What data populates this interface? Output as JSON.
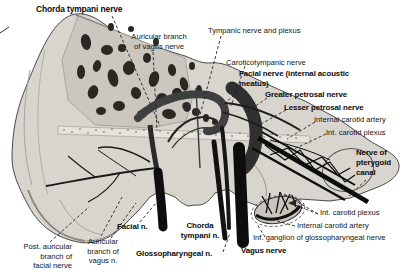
{
  "labels": {
    "chorda_tympani_top": {
      "text": "Chorda tympani nerve"
    },
    "auricular_vagus_top": {
      "text": "Auricular branch\nof vagus nerve"
    },
    "tympanic_plexus": {
      "text": "Tympanic nerve and plexus"
    },
    "caroticotympanic": {
      "text": "Caroticotympanic nerve"
    },
    "facial_iam": {
      "text": "Facial nerve (internal acoustic\nmeatus)"
    },
    "greater_petrosal": {
      "text": "Greater petrosal nerve"
    },
    "lesser_petrosal": {
      "text": "Lesser petrosal nerve"
    },
    "internal_carotid_artery_upper": {
      "text": "Internal carotid artery"
    },
    "int_carotid_plexus_upper": {
      "text": "Int. carotid plexus"
    },
    "nerve_pterygoid_canal": {
      "text": "Nerve of\npterygoid\ncanal"
    },
    "int_carotid_plexus_lower": {
      "text": "Int. carotid plexus"
    },
    "internal_carotid_artery_lower": {
      "text": "Internal carotid artery"
    },
    "inf_ganglion": {
      "text": "Inf. ganglion of glossopharyngeal nerve"
    },
    "vagus_nerve": {
      "text": "Vagus nerve"
    },
    "glossopharyngeal": {
      "text": "Glossopharyngeal n."
    },
    "chorda_tympani_bottom": {
      "text": "Chorda\ntympani n."
    },
    "facial_bottom": {
      "text": "Facial n."
    },
    "auricular_vagus_bottom": {
      "text": "Auricular\nbranch of\nvagus n."
    },
    "post_auricular": {
      "text": "Post. auricular\nbranch of\nfacial nerve"
    }
  },
  "colors": {
    "background": "#ffffff",
    "ink": "#111111",
    "bone_fill": "#d8d5cf",
    "bone_shadow": "#8d877d",
    "section_fill": "#cbc7bf",
    "air_cell": "#2b2824",
    "label_text": "#141414"
  }
}
